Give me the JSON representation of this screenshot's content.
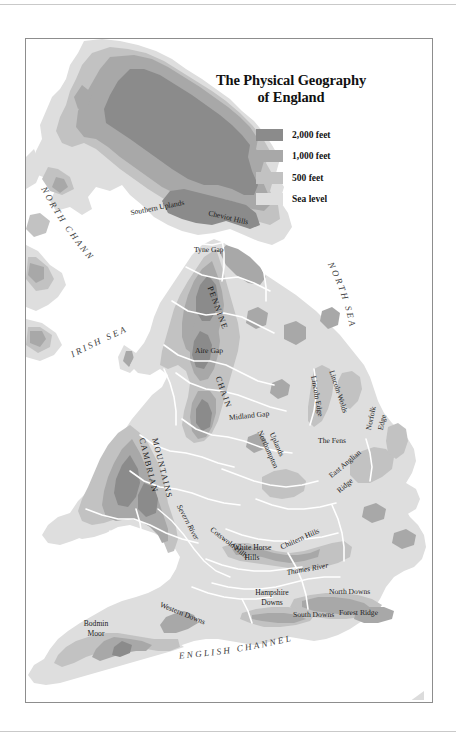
{
  "figure": {
    "kind": "physical-relief-map"
  },
  "title": {
    "line1": "The Physical Geography",
    "line2": "of England"
  },
  "legend": {
    "items": [
      {
        "label": "2,000 feet",
        "color": "#8b8b8b"
      },
      {
        "label": "1,000 feet",
        "color": "#a8a8a8"
      },
      {
        "label": "500 feet",
        "color": "#c2c2c2"
      },
      {
        "label": "Sea level",
        "color": "#dedede"
      }
    ]
  },
  "palette": {
    "sea": "#ffffff",
    "sea_level": "#dedede",
    "elev_500": "#c2c2c2",
    "elev_1000": "#a8a8a8",
    "elev_2000": "#8b8b8b",
    "border_line": "#ffffff",
    "frame": "#8d8d8d",
    "text": "#1b1b1b"
  },
  "water_labels": [
    {
      "name": "north-channel",
      "text": "NORTH CHANNEL"
    },
    {
      "name": "irish-sea",
      "text": "IRISH SEA"
    },
    {
      "name": "north-sea",
      "text": "NORTH SEA"
    },
    {
      "name": "english-channel",
      "text": "ENGLISH CHANNEL"
    }
  ],
  "map_labels": [
    {
      "name": "southern-uplands",
      "text": "Southern Uplands"
    },
    {
      "name": "cheviot-hills",
      "text": "Cheviot Hills"
    },
    {
      "name": "tyne-gap",
      "text": "Tyne Gap"
    },
    {
      "name": "pennine",
      "text": "PENNINE"
    },
    {
      "name": "aire-gap",
      "text": "Aire Gap"
    },
    {
      "name": "chain",
      "text": "CHAIN"
    },
    {
      "name": "lincoln-edge",
      "text": "Lincoln Edge"
    },
    {
      "name": "lincoln-wolds",
      "text": "Lincoln Wolds"
    },
    {
      "name": "midland-gap",
      "text": "Midland Gap"
    },
    {
      "name": "cambrian-mountains",
      "text": "CAMBRIAN MOUNTAINS"
    },
    {
      "name": "northampton-uplands",
      "text": "Northampton Uplands"
    },
    {
      "name": "the-fens",
      "text": "The Fens"
    },
    {
      "name": "norfolk-edge",
      "text": "Norfolk Edge"
    },
    {
      "name": "east-anglian-ridge",
      "text": "East Anglian Ridge"
    },
    {
      "name": "severn-river",
      "text": "Severn River"
    },
    {
      "name": "cotswold-hills",
      "text": "Cotswold Hills"
    },
    {
      "name": "white-horse-hills",
      "text": "White Horse Hills"
    },
    {
      "name": "chiltern-hills",
      "text": "Chiltern Hills"
    },
    {
      "name": "thames-river",
      "text": "Thames River"
    },
    {
      "name": "north-downs",
      "text": "North Downs"
    },
    {
      "name": "hampshire-downs",
      "text": "Hampshire Downs"
    },
    {
      "name": "forest-ridge",
      "text": "Forest Ridge"
    },
    {
      "name": "south-downs",
      "text": "South Downs"
    },
    {
      "name": "western-downs",
      "text": "Western Downs"
    },
    {
      "name": "bodmin-moor",
      "text": "Bodmin Moor"
    }
  ],
  "label_text": {
    "southern_uplands": "Southern Uplands",
    "cheviot_hills": "Cheviot Hills",
    "tyne_gap": "Tyne Gap",
    "pennine": "PENNINE",
    "aire_gap": "Aire Gap",
    "chain": "CHAIN",
    "lincoln_edge": "Lincoln Edge",
    "lincoln_wolds": "Lincoln Wolds",
    "midland_gap": "Midland Gap",
    "cambrian": "CAMBRIAN",
    "mountains": "MOUNTAINS",
    "northampton": "Northampton",
    "uplands": "Uplands",
    "the_fens": "The Fens",
    "norfolk": "Norfolk",
    "edge": "Edge",
    "east_anglian": "East Anglian",
    "ridge": "Ridge",
    "severn_river": "Severn River",
    "cotswold_hills": "Cotswold Hills",
    "white_horse": "White Horse",
    "hills": "Hills",
    "chiltern_hills": "Chiltern Hills",
    "thames_river": "Thames River",
    "north_downs": "North Downs",
    "hampshire": "Hampshire",
    "downs": "Downs",
    "forest_ridge": "Forest Ridge",
    "south_downs": "South Downs",
    "western_downs": "Western Downs",
    "bodmin": "Bodmin",
    "moor": "Moor",
    "north_channel": "NORTH CHANNEL",
    "irish_sea": "IRISH SEA",
    "north_sea": "NORTH SEA",
    "english_channel": "ENGLISH CHANNEL"
  }
}
